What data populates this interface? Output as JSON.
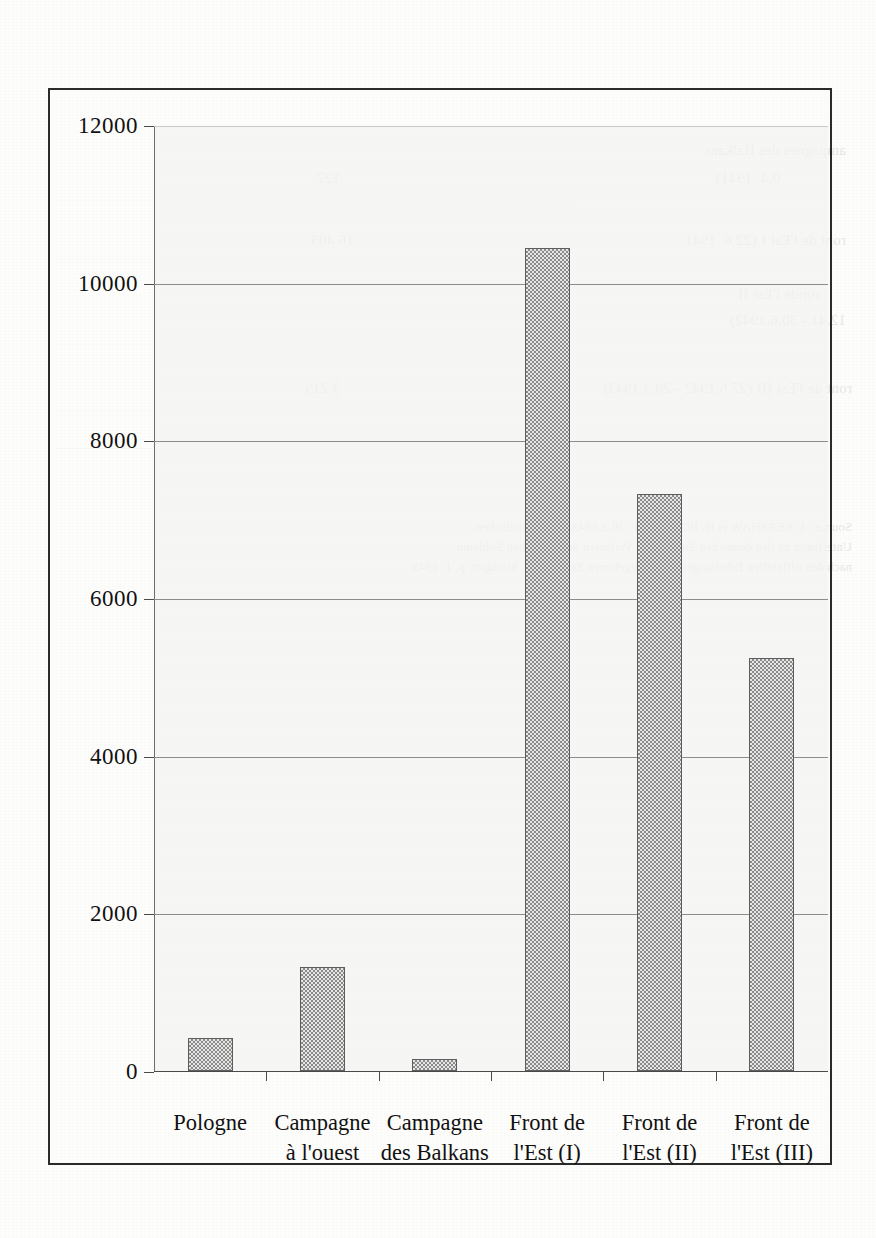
{
  "chart_data": {
    "type": "bar",
    "title": "",
    "xlabel": "",
    "ylabel": "",
    "categories": [
      "Pologne",
      "Campagne à l'ouest",
      "Campagne des Balkans",
      "Front de l'Est (I)",
      "Front de l'Est (II)",
      "Front de l'Est (III)"
    ],
    "category_lines": [
      [
        "Pologne"
      ],
      [
        "Campagne",
        "à l'ouest"
      ],
      [
        "Campagne",
        "des Balkans"
      ],
      [
        "Front de",
        "l'Est (I)"
      ],
      [
        "Front de",
        "l'Est (II)"
      ],
      [
        "Front de",
        "l'Est (III)"
      ]
    ],
    "values": [
      420,
      1320,
      150,
      10440,
      7320,
      5240
    ],
    "ylim": [
      0,
      12000
    ],
    "ytick_values": [
      0,
      2000,
      4000,
      6000,
      8000,
      10000,
      12000
    ],
    "ytick_labels": [
      "0",
      "2000",
      "4000",
      "6000",
      "8000",
      "10000",
      "12000"
    ],
    "grid": true,
    "legend": "none",
    "bar_fill": "#8a8a8a",
    "bar_outline": "#5d5d5d",
    "plot_background": "#f3f3f1",
    "frame_color": "#2b2b2b"
  },
  "ghost_text": {
    "lines": [
      "ampagnes des Balkans",
      "0.4. 1941)",
      "ront de l'Est I (22 6. 1941",
      "ronde l'Est II",
      "12.41 - 30.6.1942)",
      "ront de l'Est III (27.6.1942 - 20.3.1943)",
      "Source : I. KERSHAW et H. BOLDORFF, 30.3.1943, Die Statistischen",
      "Unterlagen zu den deutschen Stellen und Verlusten der deutschen Soldaten",
      "nach den offiziellen Erhebungen des angegebenen Zeitraumes, Stuttgart, p. 1, 1943",
      "127",
      "16 403",
      "3 219"
    ]
  }
}
